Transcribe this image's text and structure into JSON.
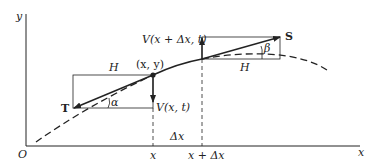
{
  "diagram": {
    "labels": {
      "y_axis": "y",
      "x_axis": "x",
      "origin": "O",
      "point": "(x, y)",
      "H_left": "H",
      "H_right": "H",
      "T": "T",
      "S": "S",
      "alpha": "α",
      "beta": "β",
      "V_left": "V(x, t)",
      "V_right": "V(x + Δx, t)",
      "delta_x": "Δx",
      "tick_x": "x",
      "tick_x_dx": "x + Δx"
    },
    "colors": {
      "ink": "#222222",
      "background": "#ffffff"
    }
  }
}
